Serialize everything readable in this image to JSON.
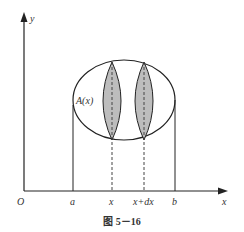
{
  "figure": {
    "caption": "图 5－16",
    "axes": {
      "x_label": "x",
      "y_label": "y",
      "origin_label": "O"
    },
    "ticks": {
      "a": "a",
      "x": "x",
      "x_dx": "x+dx",
      "b": "b"
    },
    "cross_section_label": "A(x)",
    "colors": {
      "stroke": "#222222",
      "lens_fill": "#bdbdbd",
      "background": "#ffffff"
    }
  }
}
